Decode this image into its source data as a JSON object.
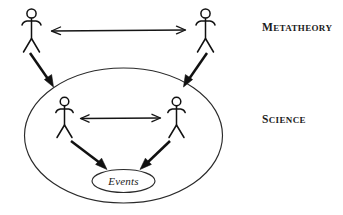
{
  "diagram": {
    "background_color": "#ffffff",
    "ink_color": "#111111",
    "labels": {
      "metatheory": {
        "initial": "M",
        "rest": "ETATHEORY",
        "full": "METATHEORY"
      },
      "science": {
        "initial": "S",
        "rest": "CIENCE",
        "full": "SCIENCE"
      },
      "events": {
        "text": "Events"
      }
    },
    "levels": [
      {
        "name": "metatheory",
        "label": "METATHEORY",
        "actor_count": 2,
        "actors": [
          "metatheorist-left",
          "metatheorist-right"
        ],
        "relation": "bidirectional",
        "enclosed": false
      },
      {
        "name": "science",
        "label": "SCIENCE",
        "actor_count": 2,
        "actors": [
          "scientist-left",
          "scientist-right"
        ],
        "relation": "bidirectional",
        "enclosed": true,
        "contains": [
          "Events"
        ]
      }
    ],
    "connections": [
      {
        "from": "metatheorist-left",
        "to": "metatheorist-right",
        "style": "double-headed",
        "weight": "thin"
      },
      {
        "from": "scientist-left",
        "to": "scientist-right",
        "style": "double-headed",
        "weight": "thin"
      },
      {
        "from": "metatheorist-left",
        "to": "science-ellipse",
        "style": "single-headed",
        "weight": "thick"
      },
      {
        "from": "metatheorist-right",
        "to": "science-ellipse",
        "style": "single-headed",
        "weight": "thick"
      },
      {
        "from": "scientist-left",
        "to": "events",
        "style": "single-headed",
        "weight": "thick"
      },
      {
        "from": "scientist-right",
        "to": "events",
        "style": "single-headed",
        "weight": "thick"
      }
    ]
  }
}
